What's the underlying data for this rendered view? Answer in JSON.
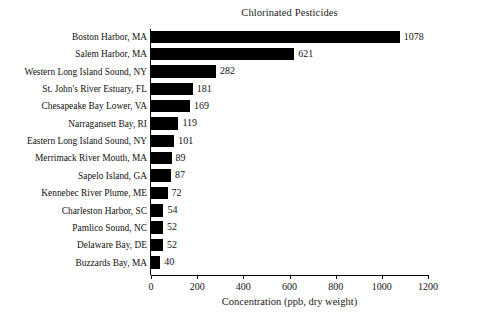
{
  "chart_data": {
    "type": "bar",
    "orientation": "horizontal",
    "title": "Chlorinated Pesticides",
    "xlabel": "Concentration (ppb, dry weight)",
    "ylabel": "",
    "xlim": [
      0,
      1200
    ],
    "xticks": [
      0,
      200,
      400,
      600,
      800,
      1000,
      1200
    ],
    "xtick_labels": [
      "0",
      "200",
      "400",
      "600",
      "800",
      "1000",
      "1200"
    ],
    "grid": false,
    "legend": false,
    "bar_color": "#000000",
    "background_color": "#ffffff",
    "categories": [
      "Boston Harbor, MA",
      "Salem Harbor, MA",
      "Western Long Island Sound, NY",
      "St. John's River Estuary, FL",
      "Chesapeake Bay Lower, VA",
      "Narragansett Bay, RI",
      "Eastern Long Island Sound, NY",
      "Merrimack River Mouth, MA",
      "Sapelo Island, GA",
      "Kennebec River Plume, ME",
      "Charleston Harbor, SC",
      "Pamlico Sound, NC",
      "Delaware Bay, DE",
      "Buzzards Bay, MA"
    ],
    "values": [
      1078,
      621,
      282,
      181,
      169,
      119,
      101,
      89,
      87,
      72,
      54,
      52,
      52,
      40
    ],
    "data_labels": [
      "1078",
      "621",
      "282",
      "181",
      "169",
      "119",
      "101",
      "89",
      "87",
      "72",
      "54",
      "52",
      "52",
      "40"
    ]
  }
}
